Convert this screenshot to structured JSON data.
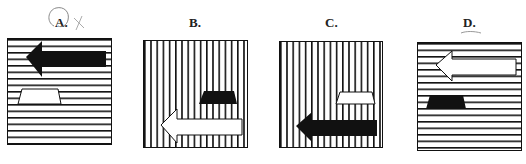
{
  "options": [
    {
      "label": "A.",
      "stripes": "horizontal",
      "arrow_fill": "black",
      "arrow_pos": "top",
      "trapezoid_fill": "white",
      "trapezoid_pos": "left",
      "annotation": "circled-with-x"
    },
    {
      "label": "B.",
      "stripes": "vertical",
      "arrow_fill": "white",
      "arrow_pos": "bottom",
      "trapezoid_fill": "black",
      "trapezoid_pos": "right"
    },
    {
      "label": "C.",
      "stripes": "vertical",
      "arrow_fill": "black",
      "arrow_pos": "bottom",
      "trapezoid_fill": "white",
      "trapezoid_pos": "right"
    },
    {
      "label": "D.",
      "stripes": "horizontal",
      "arrow_fill": "white",
      "arrow_pos": "top",
      "trapezoid_fill": "black",
      "trapezoid_pos": "left",
      "annotation": "underlined"
    }
  ]
}
